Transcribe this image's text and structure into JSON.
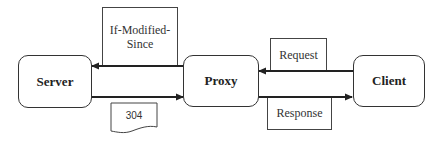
{
  "diagram": {
    "nodes": {
      "server": {
        "label": "Server"
      },
      "proxy": {
        "label": "Proxy"
      },
      "client": {
        "label": "Client"
      }
    },
    "edges": [
      {
        "from": "proxy",
        "to": "server",
        "label": "If-Modified-Since"
      },
      {
        "from": "server",
        "to": "proxy",
        "label": "304"
      },
      {
        "from": "client",
        "to": "proxy",
        "label": "Request"
      },
      {
        "from": "proxy",
        "to": "client",
        "label": "Response"
      }
    ],
    "labels": {
      "if_modified_line1": "If-Modified-",
      "if_modified_line2": "Since",
      "not_modified": "304",
      "request": "Request",
      "response": "Response"
    }
  }
}
